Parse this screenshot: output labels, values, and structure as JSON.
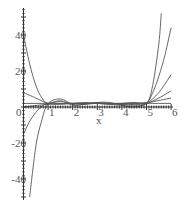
{
  "chart_data": {
    "type": "line",
    "title": "",
    "xlabel": "x",
    "ylabel": "",
    "xlim": [
      0,
      6
    ],
    "ylim": [
      -50,
      55
    ],
    "grid": false,
    "legend": null,
    "x_ticks": [
      "0",
      "1",
      "2",
      "3",
      "4",
      "5",
      "6"
    ],
    "y_ticks": [
      "40",
      "20",
      "-20",
      "-40"
    ],
    "series": [
      {
        "name": "curve-1",
        "x": [
          0,
          0.25,
          0.5,
          0.75,
          1,
          1.5,
          2,
          2.5,
          3,
          3.5,
          4,
          4.5,
          5,
          5.25,
          5.5,
          5.6
        ],
        "values": [
          40,
          24,
          12,
          5,
          2,
          3.5,
          1,
          1.5,
          2,
          1.5,
          1,
          1.5,
          2,
          12,
          35,
          52
        ]
      },
      {
        "name": "curve-2",
        "x": [
          0.25,
          0.5,
          0.75,
          1,
          1.5,
          2,
          2.5,
          3,
          3.5,
          4,
          4.5,
          5,
          5.25,
          5.5,
          5.75,
          6
        ],
        "values": [
          -50,
          -22,
          -7,
          2,
          4.5,
          1.5,
          1.5,
          2.5,
          2.5,
          1,
          0,
          2,
          8,
          17,
          29,
          44
        ]
      },
      {
        "name": "curve-3",
        "x": [
          0,
          0.25,
          0.5,
          0.75,
          1,
          1.5,
          2,
          2.5,
          3,
          3.5,
          4,
          4.5,
          5,
          5.5,
          6
        ],
        "values": [
          -15,
          -8,
          -3,
          0.5,
          2,
          3,
          2,
          2,
          2.5,
          2,
          1.5,
          1,
          2,
          8,
          18
        ]
      },
      {
        "name": "curve-4",
        "x": [
          0,
          0.5,
          1,
          1.5,
          2,
          2.5,
          3,
          3.5,
          4,
          4.5,
          5,
          5.5,
          6
        ],
        "values": [
          8,
          5,
          2,
          1.5,
          2,
          2.5,
          2,
          1.5,
          2,
          2.5,
          2,
          5,
          9
        ]
      },
      {
        "name": "curve-5",
        "x": [
          0,
          1,
          2,
          3,
          4,
          5,
          6
        ],
        "values": [
          0,
          1.5,
          2,
          2,
          2,
          2.5,
          5
        ]
      },
      {
        "name": "line-6",
        "x": [
          0,
          6
        ],
        "values": [
          2,
          2
        ]
      }
    ]
  }
}
